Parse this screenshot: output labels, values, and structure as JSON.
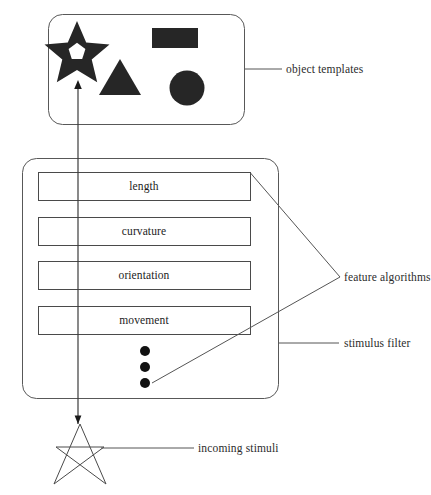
{
  "diagram": {
    "colors": {
      "stroke": "#555555",
      "shape_fill": "#262626",
      "text": "#1c1c1c",
      "background": "#ffffff"
    },
    "object_templates": {
      "label": "object templates",
      "shapes": [
        {
          "name": "star-shape",
          "type": "star",
          "filled": true
        },
        {
          "name": "rectangle-shape",
          "type": "rectangle",
          "filled": true
        },
        {
          "name": "triangle-shape",
          "type": "triangle",
          "filled": true
        },
        {
          "name": "circle-shape",
          "type": "circle",
          "filled": true
        }
      ]
    },
    "stimulus_filter": {
      "label": "stimulus filter",
      "feature_algorithms_label": "feature algorithms",
      "features": [
        {
          "label": "length"
        },
        {
          "label": "curvature"
        },
        {
          "label": "orientation"
        },
        {
          "label": "movement"
        }
      ],
      "ellipsis_dots": 3
    },
    "incoming_stimuli": {
      "label": "incoming stimuli",
      "shape": "star-outline"
    },
    "flow_arrow": {
      "name": "upward-flow-arrow",
      "from": "incoming stimuli",
      "to": "object templates"
    }
  }
}
